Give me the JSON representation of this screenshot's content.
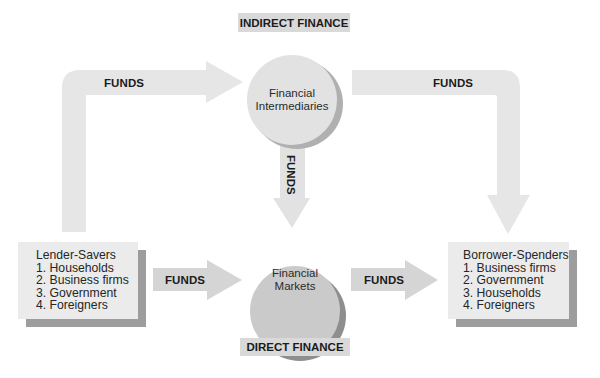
{
  "title_top": "INDIRECT FINANCE",
  "title_bottom": "DIRECT FINANCE",
  "nodes": {
    "intermediaries": {
      "line1": "Financial",
      "line2": "Intermediaries"
    },
    "markets": {
      "line1": "Financial",
      "line2": "Markets"
    }
  },
  "lenders": {
    "heading": "Lender-Savers",
    "items": [
      "1. Households",
      "2. Business firms",
      "3. Government",
      "4. Foreigners"
    ]
  },
  "borrowers": {
    "heading": "Borrower-Spenders",
    "items": [
      "1. Business firms",
      "2. Government",
      "3. Households",
      "4. Foreigners"
    ]
  },
  "arrows": {
    "lenders_to_intermediaries": "FUNDS",
    "intermediaries_to_borrowers": "FUNDS",
    "intermediaries_to_markets": "FUNDS",
    "lenders_to_markets": "FUNDS",
    "markets_to_borrowers": "FUNDS"
  },
  "colors": {
    "arrow_light": "#e6e6e6",
    "arrow_mid": "#d4d4d4",
    "circle_top": "#e2e2e2",
    "circle_bottom": "#cacaca",
    "shadow": "#9d9d9d",
    "box": "#ebebeb",
    "tag": "#d9d9d9"
  }
}
